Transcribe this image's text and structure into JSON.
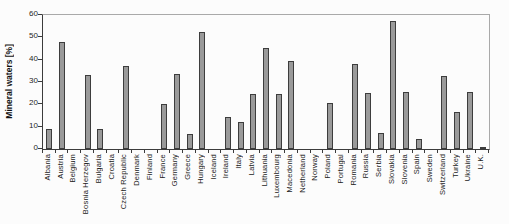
{
  "chart_data": {
    "type": "bar",
    "title": "",
    "xlabel": "",
    "ylabel": "Mineral waters [%]",
    "ylim": [
      0,
      60
    ],
    "yticks": [
      0,
      10,
      20,
      30,
      40,
      50,
      60
    ],
    "grid": false,
    "legend_position": "none",
    "bar_fill_color": "#9a9a9a",
    "bar_border_color": "#3d3d3d",
    "categories": [
      "Albania",
      "Austria",
      "Belgium",
      "Bosnia Herzegov",
      "Bulgaria",
      "Croatia",
      "Czech Republic",
      "Denmark",
      "Finland",
      "France",
      "Germany",
      "Greece",
      "Hungary",
      "Iceland",
      "Ireland",
      "Italy",
      "Latvia",
      "Lithuania",
      "Luxembourg",
      "Macedonia",
      "Netherland",
      "Norway",
      "Poland",
      "Portugal",
      "Romania",
      "Russia",
      "Serbia",
      "Slovakia",
      "Slovenia",
      "Spain",
      "Sweden",
      "Switzerland",
      "Turkey",
      "Ukraine",
      "U.K."
    ],
    "values": [
      9,
      48,
      0,
      33,
      9,
      0,
      37,
      0,
      0,
      20,
      33.5,
      6.5,
      52.5,
      0,
      14.5,
      12,
      24.5,
      45,
      24.5,
      39.5,
      0,
      0,
      20.5,
      0,
      38,
      25,
      7,
      57.5,
      25.5,
      4.5,
      0,
      32.5,
      16.5,
      25.5,
      1
    ]
  }
}
